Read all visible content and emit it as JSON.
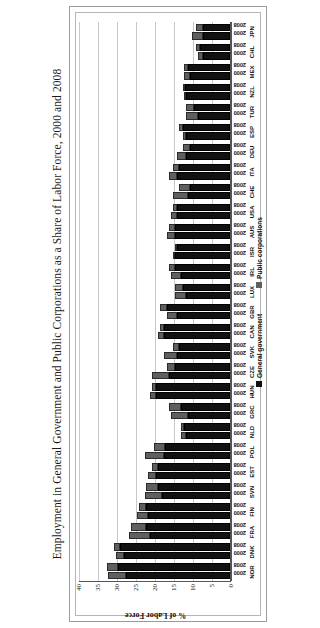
{
  "figure": {
    "title": "Employment in General Government and Public Corporations as a Share of Labor Force, 2000 and 2008"
  },
  "axis": {
    "y_title": "% of Labor Force",
    "y_ticks": [
      "40",
      "35",
      "30",
      "25",
      "20",
      "15",
      "10",
      "5",
      "0"
    ]
  },
  "legend": {
    "items": [
      {
        "label": "General government",
        "color": "#111111",
        "swatch": "legend-swatch-general-government"
      },
      {
        "label": "Public corporations",
        "color": "#5f5f5f",
        "swatch": "legend-swatch-public-corporations"
      }
    ]
  },
  "year_labels": [
    "2000",
    "2008"
  ],
  "chart_data": {
    "type": "bar",
    "orientation": "vertical-grouped-stacked",
    "title": "Employment in General Government and Public Corporations as a Share of Labor Force, 2000 and 2008",
    "xlabel": "",
    "ylabel": "% of Labor Force",
    "ylim": [
      0,
      40
    ],
    "ytick_interval": 5,
    "grid": "horizontal",
    "legend_position": "bottom",
    "categories": [
      "NOR",
      "DNK",
      "FRA",
      "FIN",
      "SVN",
      "EST",
      "POL",
      "NLD",
      "GRC",
      "HUN",
      "CZE",
      "SVK",
      "CAN",
      "GBR",
      "LUX",
      "IRL",
      "ISR",
      "AUS",
      "USA",
      "CHE",
      "ITA",
      "DEU",
      "ESP",
      "TUR",
      "NZL",
      "MEX",
      "CHL",
      "JPN"
    ],
    "groups": [
      "2000",
      "2008"
    ],
    "stack_order": [
      "General government",
      "Public corporations"
    ],
    "series": [
      {
        "name": "General government",
        "group": "2000",
        "values": [
          27.5,
          28.0,
          21.0,
          21.5,
          18.0,
          19.5,
          17.5,
          11.5,
          11.0,
          19.5,
          16.0,
          14.0,
          17.5,
          14.0,
          11.5,
          13.0,
          14.5,
          14.5,
          14.0,
          11.0,
          14.0,
          11.5,
          11.5,
          8.5,
          11.5,
          10.5,
          7.0,
          7.0
        ]
      },
      {
        "name": "Public corporations",
        "group": "2000",
        "values": [
          4.5,
          2.0,
          5.5,
          3.0,
          4.5,
          2.0,
          5.0,
          1.5,
          4.5,
          1.5,
          4.5,
          3.5,
          1.5,
          2.5,
          3.0,
          2.5,
          0.5,
          2.0,
          1.5,
          4.0,
          2.0,
          2.5,
          1.0,
          3.0,
          0.5,
          1.5,
          1.5,
          3.0
        ]
      },
      {
        "name": "General government",
        "group": "2008",
        "values": [
          29.5,
          29.0,
          22.0,
          22.0,
          19.0,
          19.0,
          17.0,
          12.0,
          13.0,
          19.5,
          14.5,
          13.5,
          17.5,
          16.5,
          12.5,
          14.5,
          14.0,
          14.5,
          14.0,
          10.5,
          13.5,
          10.5,
          12.5,
          9.5,
          12.0,
          11.0,
          8.0,
          7.0
        ]
      },
      {
        "name": "Public corporations",
        "group": "2008",
        "values": [
          3.0,
          1.5,
          4.0,
          2.0,
          3.0,
          1.5,
          3.0,
          1.0,
          3.0,
          1.0,
          2.0,
          1.5,
          1.0,
          2.0,
          2.0,
          1.5,
          0.5,
          1.5,
          1.0,
          3.0,
          1.5,
          2.0,
          1.0,
          2.0,
          0.5,
          1.0,
          1.0,
          2.0
        ]
      }
    ]
  }
}
